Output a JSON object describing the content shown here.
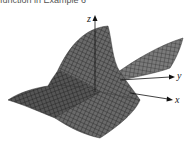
{
  "caption": "function in Example 6",
  "figure": {
    "type": "3d-surface-plot",
    "axes": {
      "x": "x",
      "y": "y",
      "z": "z"
    },
    "surface_color": "#5a5a5a",
    "grid_color": "#1e1e1e"
  }
}
